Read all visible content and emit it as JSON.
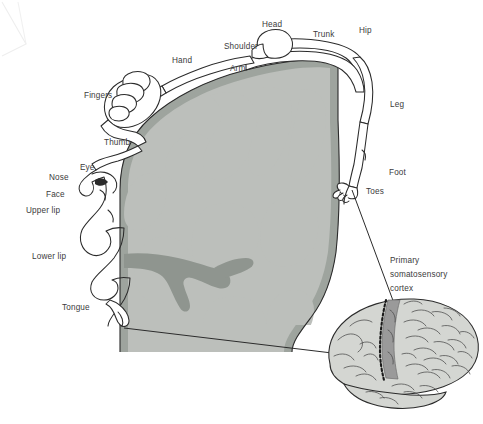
{
  "figure": {
    "type": "anatomical-diagram",
    "background_color": "#ffffff",
    "ink_color": "#2b2b2b",
    "cortex_colors": {
      "white_matter": "#b9bcb8",
      "gray_matter": "#9ea49e",
      "outline": "#2b2b2b"
    },
    "brain_colors": {
      "fill": "#d2d4d0",
      "somatosensory_band": "#9a9a9a",
      "sulcus_dotted": "#1a1a1a"
    }
  },
  "labels": {
    "head": "Head",
    "trunk": "Trunk",
    "hip": "Hip",
    "shoulder": "Shoulder",
    "arm": "Arm",
    "hand": "Hand",
    "fingers": "Fingers",
    "thumb": "Thumb",
    "eye": "Eye",
    "nose": "Nose",
    "face": "Face",
    "upper_lip": "Upper lip",
    "lower_lip": "Lower lip",
    "tongue": "Tongue",
    "leg": "Leg",
    "foot": "Foot",
    "toes": "Toes",
    "cortex_line1": "Primary",
    "cortex_line2": "somatosensory",
    "cortex_line3": "cortex"
  },
  "label_order_dorsal_to_ventral": [
    "Hip",
    "Trunk",
    "Head",
    "Shoulder",
    "Arm",
    "Hand",
    "Fingers",
    "Thumb",
    "Eye",
    "Nose",
    "Face",
    "Upper lip",
    "Lower lip",
    "Tongue"
  ],
  "label_order_medial": [
    "Hip",
    "Leg",
    "Foot",
    "Toes"
  ],
  "callout": {
    "target": "Primary somatosensory cortex",
    "text": "Primary somatosensory cortex"
  }
}
